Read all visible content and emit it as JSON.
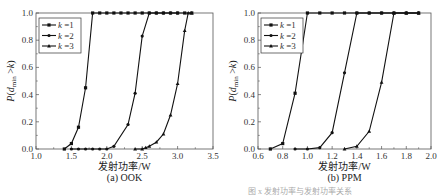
{
  "figure_caption": "图 x  发射功率与发射功率关系",
  "chart_data": [
    {
      "type": "line",
      "subtitle": "(a) OOK",
      "xlabel": "发射功率/W",
      "ylabel": "P(d_min > k)",
      "xlim": [
        1.0,
        3.5
      ],
      "ylim": [
        0.0,
        1.0
      ],
      "xticks": [
        "1.0",
        "1.5",
        "2.0",
        "2.5",
        "3.0",
        "3.5"
      ],
      "yticks": [
        "0.0",
        "0.2",
        "0.4",
        "0.6",
        "0.8",
        "1.0"
      ],
      "grid": false,
      "legend_position": "upper-left",
      "series": [
        {
          "name": "k = 1",
          "marker": "square",
          "x": [
            1.4,
            1.5,
            1.6,
            1.7,
            1.8,
            1.9,
            2.0,
            2.1,
            2.2,
            2.3,
            2.4,
            2.5,
            2.6,
            2.7,
            2.8,
            2.9,
            3.0,
            3.1,
            3.2
          ],
          "y": [
            0.0,
            0.04,
            0.16,
            0.45,
            1.0,
            1.0,
            1.0,
            1.0,
            1.0,
            1.0,
            1.0,
            1.0,
            1.0,
            1.0,
            1.0,
            1.0,
            1.0,
            1.0,
            1.0
          ]
        },
        {
          "name": "k = 2",
          "marker": "circle",
          "x": [
            1.5,
            1.6,
            1.7,
            1.8,
            1.9,
            2.0,
            2.1,
            2.3,
            2.4,
            2.5,
            2.6,
            2.7,
            2.8,
            2.9,
            3.0
          ],
          "y": [
            0.0,
            0.0,
            0.0,
            0.0,
            0.0,
            0.0,
            0.02,
            0.18,
            0.41,
            0.83,
            1.0,
            1.0,
            1.0,
            1.0,
            1.0
          ]
        },
        {
          "name": "k = 3",
          "marker": "triangle",
          "x": [
            2.4,
            2.5,
            2.55,
            2.6,
            2.7,
            2.8,
            2.9,
            3.0,
            3.1,
            3.15,
            3.2
          ],
          "y": [
            0.0,
            0.0,
            0.01,
            0.02,
            0.05,
            0.11,
            0.25,
            0.48,
            0.87,
            1.0,
            1.0
          ]
        }
      ]
    },
    {
      "type": "line",
      "subtitle": "(b) PPM",
      "xlabel": "发射功率/W",
      "ylabel": "P(d_min > k)",
      "xlim": [
        0.6,
        2.0
      ],
      "ylim": [
        0.0,
        1.0
      ],
      "xticks": [
        "0.6",
        "0.8",
        "1.0",
        "1.2",
        "1.4",
        "1.6",
        "1.8",
        "2.0"
      ],
      "yticks": [
        "0.0",
        "0.2",
        "0.4",
        "0.6",
        "0.8",
        "1.0"
      ],
      "grid": false,
      "legend_position": "upper-left",
      "series": [
        {
          "name": "k = 1",
          "marker": "square",
          "x": [
            0.7,
            0.8,
            0.9,
            1.0,
            1.1,
            1.2,
            1.3,
            1.4,
            1.5,
            1.6,
            1.7,
            1.8,
            1.9
          ],
          "y": [
            0.0,
            0.04,
            0.41,
            1.0,
            1.0,
            1.0,
            1.0,
            1.0,
            1.0,
            1.0,
            1.0,
            1.0,
            1.0
          ]
        },
        {
          "name": "k = 2",
          "marker": "circle",
          "x": [
            0.9,
            1.0,
            1.1,
            1.2,
            1.3,
            1.4,
            1.5,
            1.6,
            1.7,
            1.8,
            1.9
          ],
          "y": [
            0.0,
            0.0,
            0.01,
            0.12,
            0.56,
            1.0,
            1.0,
            1.0,
            1.0,
            1.0,
            1.0
          ]
        },
        {
          "name": "k = 3",
          "marker": "triangle",
          "x": [
            1.3,
            1.4,
            1.5,
            1.6,
            1.7,
            1.8,
            1.9
          ],
          "y": [
            0.0,
            0.02,
            0.13,
            0.49,
            1.0,
            1.0,
            1.0
          ]
        }
      ]
    }
  ]
}
